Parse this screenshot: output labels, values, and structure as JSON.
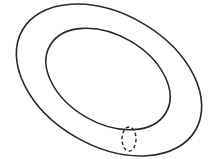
{
  "diagram": {
    "type": "torus-with-cross-section",
    "background": "#ffffff",
    "stroke_color": "#2a2a2a",
    "outer_ellipse": {
      "cx": 109,
      "cy": 80,
      "rx": 100,
      "ry": 66,
      "rotate": 30,
      "stroke_width": 1.6
    },
    "inner_ellipse": {
      "cx": 108,
      "cy": 79,
      "rx": 67,
      "ry": 44,
      "rotate": 30,
      "stroke_width": 1.6
    },
    "cross_section": {
      "cx": 129,
      "cy": 139,
      "rx": 7,
      "ry": 12,
      "dashed": true,
      "stroke_width": 1.4
    }
  }
}
